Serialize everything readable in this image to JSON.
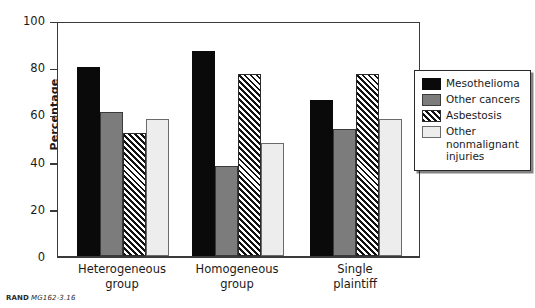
{
  "figure": {
    "source_caption_mark": "RAND",
    "source_caption_id": "MG162-3.16",
    "cropped_title_remnant": "grouped by plaintiff type"
  },
  "chart_data": {
    "type": "bar",
    "title": "",
    "xlabel": "",
    "ylabel": "Percentage",
    "ylim": [
      0,
      100
    ],
    "yticks": [
      0,
      20,
      40,
      60,
      80,
      100
    ],
    "ytick_labels": [
      "0",
      "20",
      "40",
      "60",
      "80",
      "100"
    ],
    "grid": false,
    "legend_position": "right",
    "categories": [
      "Heterogeneous group",
      "Homogeneous group",
      "Single plaintiff"
    ],
    "category_lines": [
      [
        "Heterogeneous",
        "group"
      ],
      [
        "Homogeneous",
        "group"
      ],
      [
        "Single",
        "plaintiff"
      ]
    ],
    "series": [
      {
        "name": "Mesothelioma",
        "legend_label": "Mesothelioma",
        "color": "#0a0a0a",
        "fill": "solid-black",
        "values": [
          80,
          87,
          66
        ]
      },
      {
        "name": "Other cancers",
        "legend_label": "Other cancers",
        "color": "#7c7c7c",
        "fill": "solid-gray",
        "values": [
          61,
          38,
          54
        ]
      },
      {
        "name": "Asbestosis",
        "legend_label": "Asbestosis",
        "color": "#111111",
        "fill": "diagonal-hatch",
        "values": [
          52,
          77,
          77
        ]
      },
      {
        "name": "Other nonmalignant injuries",
        "legend_label": "Other\nnonmalignant\ninjuries",
        "color": "#ededed",
        "fill": "solid-light",
        "values": [
          58,
          48,
          58
        ]
      }
    ]
  }
}
